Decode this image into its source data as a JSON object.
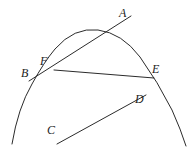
{
  "figure": {
    "background_color": "#ffffff",
    "stroke_color": "#2b2b2b",
    "label_color": "#1c1c1c",
    "width": 194,
    "height": 152
  },
  "labels": {
    "a": "A",
    "b": "B",
    "c": "C",
    "d": "D",
    "e": "E",
    "f": "F"
  },
  "label_positions": {
    "a": {
      "x": 119,
      "y": 7
    },
    "b": {
      "x": 21,
      "y": 67
    },
    "c": {
      "x": 47,
      "y": 124
    },
    "d": {
      "x": 135,
      "y": 93
    },
    "e": {
      "x": 152,
      "y": 63
    },
    "f": {
      "x": 40,
      "y": 55
    }
  },
  "geometry": {
    "parabola": {
      "name": "downward-parabola",
      "apex": {
        "x": 98,
        "y": 30
      },
      "left_end": {
        "x": 12,
        "y": 144
      },
      "right_end": {
        "x": 186,
        "y": 146
      },
      "path": "M 12 144 Q 18 108 32 84 Q 44 62 55 49 Q 74 27 98 30 Q 122 33 140 57 Q 158 82 172 110 Q 181 130 186 146"
    },
    "line_b_to_a": {
      "name": "secant-line-B-A",
      "from": {
        "x": 29,
        "y": 81
      },
      "to": {
        "x": 131,
        "y": 16
      }
    },
    "line_f_to_e": {
      "name": "chord-line-F-E",
      "from": {
        "x": 54,
        "y": 70
      },
      "to": {
        "x": 154,
        "y": 78
      }
    },
    "line_c_to_d": {
      "name": "segment-line-C-D",
      "from": {
        "x": 57,
        "y": 144
      },
      "to": {
        "x": 146,
        "y": 95
      }
    },
    "intersection_f": {
      "x": 54,
      "y": 70
    },
    "intersection_e": {
      "x": 153,
      "y": 78
    }
  }
}
